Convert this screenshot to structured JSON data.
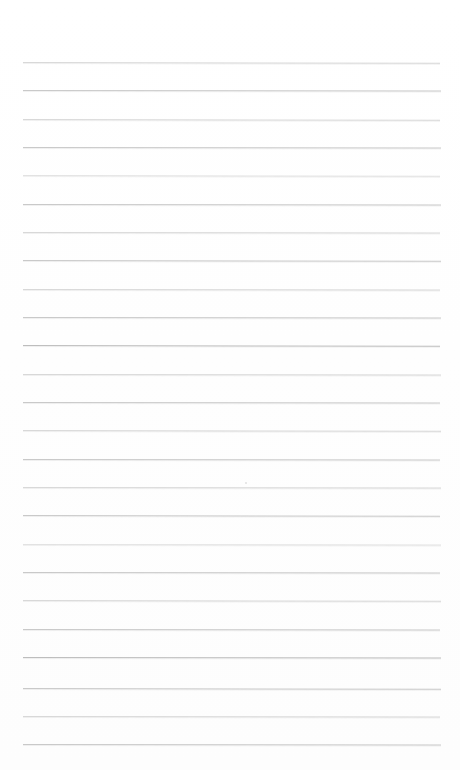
{
  "document": {
    "kind": "lined-paper-sheet",
    "title": "Blank ruled notebook page",
    "content_text": "",
    "page_width": 460,
    "page_height": 770,
    "background_color": "#ffffff",
    "rule_color": "#c9c9c9",
    "rule_count": 25,
    "rule_spacing_px": 28.4,
    "rule_left_px": 23,
    "rule_right_px": 440,
    "first_rule_y_px": 62,
    "last_rule_y_px": 744,
    "margin_rule": "none",
    "holes": "none"
  },
  "rules": [
    {
      "y": 62,
      "x1": 23,
      "x2": 440,
      "weight": "soft",
      "tilt": 0.1
    },
    {
      "y": 90,
      "x1": 23,
      "x2": 441,
      "weight": "normal",
      "tilt": 0.08
    },
    {
      "y": 119,
      "x1": 23,
      "x2": 440,
      "weight": "soft",
      "tilt": 0.1
    },
    {
      "y": 147,
      "x1": 23,
      "x2": 441,
      "weight": "normal",
      "tilt": 0.06
    },
    {
      "y": 175,
      "x1": 23,
      "x2": 440,
      "weight": "faint",
      "tilt": 0.1
    },
    {
      "y": 204,
      "x1": 23,
      "x2": 441,
      "weight": "normal",
      "tilt": 0.08
    },
    {
      "y": 232,
      "x1": 23,
      "x2": 440,
      "weight": "soft",
      "tilt": 0.06
    },
    {
      "y": 260,
      "x1": 23,
      "x2": 441,
      "weight": "normal",
      "tilt": 0.1
    },
    {
      "y": 289,
      "x1": 23,
      "x2": 440,
      "weight": "soft",
      "tilt": 0.08
    },
    {
      "y": 317,
      "x1": 23,
      "x2": 441,
      "weight": "normal",
      "tilt": 0.06
    },
    {
      "y": 345,
      "x1": 23,
      "x2": 440,
      "weight": "dark",
      "tilt": 0.1
    },
    {
      "y": 374,
      "x1": 23,
      "x2": 441,
      "weight": "soft",
      "tilt": 0.08
    },
    {
      "y": 402,
      "x1": 23,
      "x2": 440,
      "weight": "normal",
      "tilt": 0.06
    },
    {
      "y": 430,
      "x1": 23,
      "x2": 441,
      "weight": "soft",
      "tilt": 0.1
    },
    {
      "y": 459,
      "x1": 23,
      "x2": 440,
      "weight": "normal",
      "tilt": 0.08
    },
    {
      "y": 487,
      "x1": 23,
      "x2": 441,
      "weight": "soft",
      "tilt": 0.06
    },
    {
      "y": 515,
      "x1": 23,
      "x2": 440,
      "weight": "normal",
      "tilt": 0.1
    },
    {
      "y": 544,
      "x1": 23,
      "x2": 441,
      "weight": "faint",
      "tilt": 0.08
    },
    {
      "y": 572,
      "x1": 23,
      "x2": 440,
      "weight": "normal",
      "tilt": 0.06
    },
    {
      "y": 600,
      "x1": 23,
      "x2": 441,
      "weight": "soft",
      "tilt": 0.1
    },
    {
      "y": 629,
      "x1": 23,
      "x2": 440,
      "weight": "normal",
      "tilt": 0.08
    },
    {
      "y": 657,
      "x1": 23,
      "x2": 441,
      "weight": "dark",
      "tilt": 0.06
    },
    {
      "y": 688,
      "x1": 23,
      "x2": 441,
      "weight": "normal",
      "tilt": 0.1
    },
    {
      "y": 716,
      "x1": 23,
      "x2": 440,
      "weight": "soft",
      "tilt": 0.08
    },
    {
      "y": 744,
      "x1": 23,
      "x2": 441,
      "weight": "normal",
      "tilt": 0.06
    }
  ],
  "marks": [
    {
      "name": "paper-speck",
      "x": 245,
      "y": 482
    }
  ]
}
